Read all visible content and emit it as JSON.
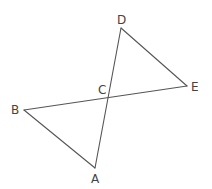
{
  "diagram": {
    "type": "geometry",
    "stroke_color": "#555555",
    "label_color": "#444444",
    "points": {
      "A": {
        "label": "A",
        "x": 95,
        "y": 168,
        "lx": 91,
        "ly": 183
      },
      "B": {
        "label": "B",
        "x": 24,
        "y": 110,
        "lx": 11,
        "ly": 114
      },
      "C": {
        "label": "C",
        "x": 108,
        "y": 97,
        "lx": 98,
        "ly": 94
      },
      "D": {
        "label": "D",
        "x": 121,
        "y": 28,
        "lx": 117,
        "ly": 24
      },
      "E": {
        "label": "E",
        "x": 187,
        "y": 86,
        "lx": 191,
        "ly": 91
      }
    },
    "segments": [
      {
        "name": "AD",
        "from": "A",
        "to": "D"
      },
      {
        "name": "BE",
        "from": "B",
        "to": "E"
      },
      {
        "name": "AB",
        "from": "A",
        "to": "B"
      },
      {
        "name": "DE",
        "from": "D",
        "to": "E"
      }
    ]
  }
}
